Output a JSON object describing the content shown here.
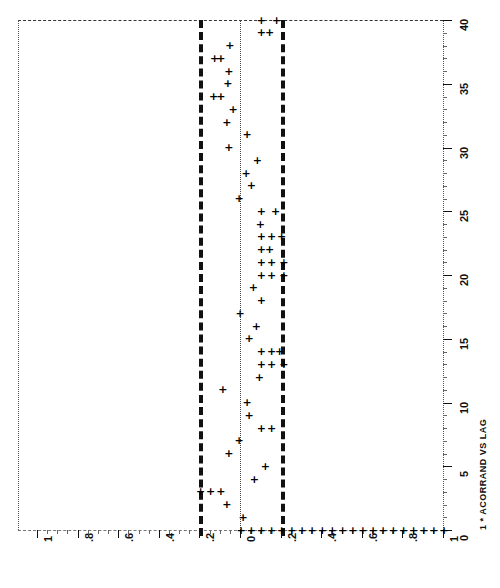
{
  "chart_data": {
    "type": "scatter",
    "title": "1 * ACORRAND VS LAG",
    "orientation": "rotated-90",
    "xlabel": "ACORRAND",
    "ylabel": "LAG",
    "plot_symbol": "+",
    "x_tick_labels": [
      "1",
      ".8",
      ".6",
      ".4",
      ".2",
      "0",
      ".2",
      ".4",
      ".6",
      ".8",
      "1"
    ],
    "x_tick_values": [
      -1,
      -0.8,
      -0.6,
      -0.4,
      -0.2,
      0,
      0.2,
      0.4,
      0.6,
      0.8,
      1
    ],
    "y_tick_labels": [
      "0",
      "5",
      "10",
      "15",
      "20",
      "25",
      "30",
      "35",
      "40"
    ],
    "y_tick_values": [
      0,
      5,
      10,
      15,
      20,
      25,
      30,
      35,
      40
    ],
    "xlim": [
      -1.0,
      1.0
    ],
    "ylim": [
      0,
      40
    ],
    "grid": false,
    "legend": "none",
    "confidence_bounds": [
      -0.2,
      0.2
    ],
    "confidence_bound_style": "thick-dashed",
    "zero_reference": 0.0,
    "zero_reference_style": "fine-dotted",
    "categories": [
      0,
      1,
      2,
      3,
      4,
      5,
      6,
      7,
      8,
      9,
      10,
      11,
      12,
      13,
      14,
      15,
      16,
      17,
      18,
      19,
      20,
      21,
      22,
      23,
      24,
      25,
      26,
      27,
      28,
      29,
      30,
      31,
      32,
      33,
      34,
      35,
      36,
      37,
      38,
      39,
      40
    ],
    "series": [
      {
        "name": "ACORRAND",
        "x": [
          0,
          1,
          2,
          3,
          4,
          5,
          6,
          7,
          8,
          9,
          10,
          11,
          12,
          13,
          14,
          15,
          16,
          17,
          18,
          19,
          20,
          21,
          22,
          23,
          24,
          25,
          26,
          27,
          28,
          29,
          30,
          31,
          32,
          33,
          34,
          35,
          36,
          37,
          38,
          39,
          40
        ],
        "values": [
          1.0,
          0.01,
          -0.07,
          -0.2,
          0.065,
          0.12,
          -0.06,
          -0.01,
          0.15,
          0.04,
          0.03,
          -0.09,
          0.09,
          0.21,
          0.19,
          0.04,
          0.075,
          -0.005,
          0.1,
          0.06,
          0.21,
          0.21,
          0.14,
          0.2,
          0.095,
          0.17,
          -0.01,
          0.05,
          0.025,
          0.08,
          -0.06,
          0.03,
          -0.07,
          -0.04,
          -0.135,
          -0.065,
          -0.06,
          -0.13,
          -0.055,
          0.14,
          0.175
        ]
      }
    ]
  }
}
